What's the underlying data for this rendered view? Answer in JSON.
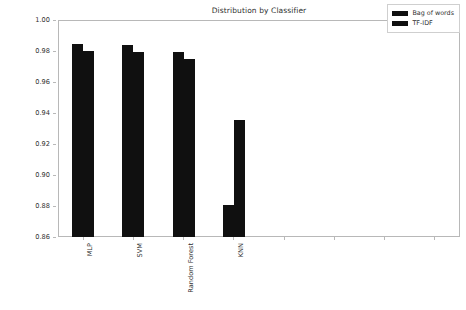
{
  "chart_data": {
    "type": "bar",
    "title": "Distribution by Classifier",
    "xlabel": "",
    "ylabel": "Accuracy Score",
    "categories": [
      "MLP",
      "SVM",
      "Random Forest",
      "KNN"
    ],
    "series": [
      {
        "name": "Bag of words",
        "color": "#101010",
        "values": [
          0.9845,
          0.9838,
          0.9794,
          0.8805
        ]
      },
      {
        "name": "TF-IDF",
        "color": "#101010",
        "values": [
          0.9797,
          0.9792,
          0.9748,
          0.9358
        ]
      }
    ],
    "ylim": [
      0.86,
      1.0
    ],
    "yticks": [
      "0.86",
      "0.88",
      "0.90",
      "0.92",
      "0.94",
      "0.96",
      "0.98",
      "1.00"
    ],
    "ytick_values": [
      0.86,
      0.88,
      0.9,
      0.92,
      0.94,
      0.96,
      0.98,
      1.0
    ],
    "xtick_positions": [
      0,
      1,
      2,
      3,
      4,
      5,
      6,
      7
    ],
    "xtick_labels": [
      "MLP",
      "SVM",
      "Random Forest",
      "KNN",
      "",
      "",
      "",
      ""
    ],
    "grid": false,
    "legend_position": "top-right",
    "legend_entries": [
      "Bag of words",
      "TF-IDF"
    ]
  },
  "figure": {
    "background": "#ffffff",
    "axis_color": "#b8b8b8",
    "text_color": "#2f2f2f"
  }
}
